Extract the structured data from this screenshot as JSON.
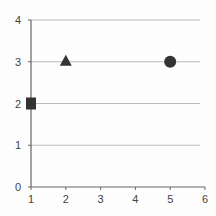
{
  "chart_data": {
    "type": "scatter",
    "title": "",
    "xlabel": "",
    "ylabel": "",
    "xlim": [
      1,
      6
    ],
    "ylim": [
      0,
      4
    ],
    "xticks": [
      "1",
      "2",
      "3",
      "4",
      "5",
      "6"
    ],
    "yticks": [
      "0",
      "1",
      "2",
      "3",
      "4"
    ],
    "grid": "horizontal",
    "legend": null,
    "points": [
      {
        "x": 1,
        "y": 2,
        "marker": "square",
        "color": "#333333"
      },
      {
        "x": 2,
        "y": 3,
        "marker": "triangle",
        "color": "#333333"
      },
      {
        "x": 5,
        "y": 3,
        "marker": "circle",
        "color": "#333333"
      }
    ]
  },
  "colors": {
    "axis": "#666666",
    "grid": "#bbbbbb",
    "marker": "#333333"
  }
}
